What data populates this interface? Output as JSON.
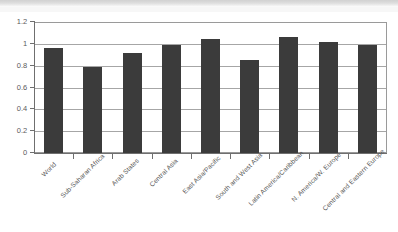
{
  "chart_data": {
    "type": "bar",
    "title": "",
    "subtitle": "",
    "xlabel": "",
    "ylabel": "",
    "ylim": [
      0,
      1.2
    ],
    "ytick_values": [
      0,
      0.2,
      0.4,
      0.6,
      0.8,
      1,
      1.2
    ],
    "ytick_labels": [
      "0",
      "0.2",
      "0.4",
      "0.6",
      "0.8",
      "1",
      "1.2"
    ],
    "grid": true,
    "grid_axis": "y",
    "legend": false,
    "legend_position": "none",
    "bar_color": "#3b3b3b",
    "categories": [
      "World",
      "Sub-Saharan Africa",
      "Arab States",
      "Central Asia",
      "East Asia/Pacific",
      "South and West Asia",
      "Latin America/Caribbean",
      "N. America/W. Europe",
      "Central and Eastern Europe"
    ],
    "values": [
      0.96,
      0.79,
      0.92,
      0.99,
      1.04,
      0.85,
      1.06,
      1.02,
      0.99
    ],
    "x_tick_rotation": -45
  },
  "axes": {
    "y_axis_name": "y-axis",
    "x_axis_name": "x-axis"
  }
}
